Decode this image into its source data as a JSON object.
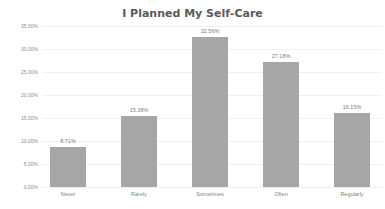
{
  "chart_data": {
    "type": "bar",
    "title": "I Planned My Self-Care",
    "xlabel": "",
    "ylabel": "",
    "categories": [
      "Never",
      "Rarely",
      "Sometimes",
      "Often",
      "Regularly"
    ],
    "values": [
      8.71,
      15.38,
      32.56,
      27.18,
      16.15
    ],
    "value_labels": [
      "8.71%",
      "15.38%",
      "32.56%",
      "27.18%",
      "16.15%"
    ],
    "yticks": [
      "0.00%",
      "5.00%",
      "10.00%",
      "15.00%",
      "20.00%",
      "25.00%",
      "30.00%",
      "35.00%"
    ],
    "ylim": [
      0,
      35
    ],
    "grid": true,
    "legend": "none",
    "bar_color": "#a6a6a6"
  }
}
